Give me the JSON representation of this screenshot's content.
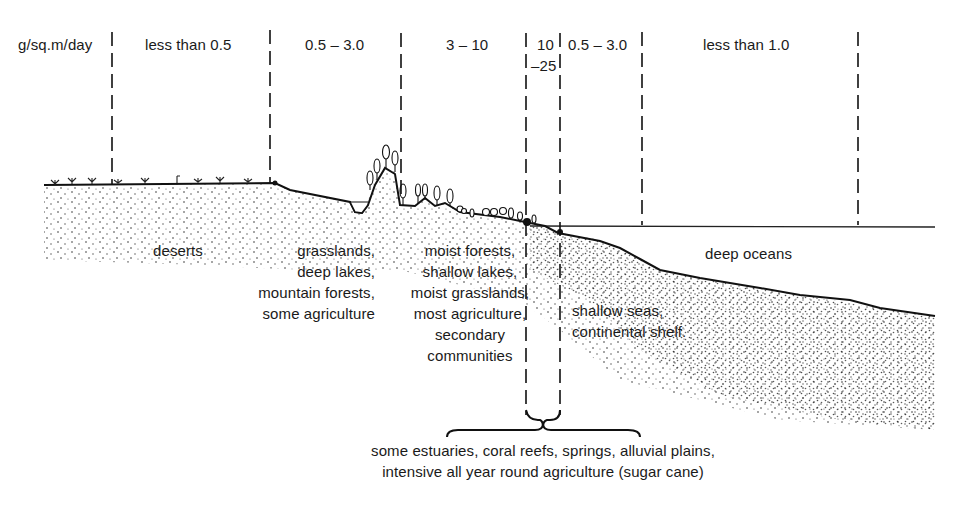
{
  "header": {
    "unit": "g/sq.m/day",
    "zones": [
      {
        "label": "less than 0.5"
      },
      {
        "label": "0.5 – 3.0"
      },
      {
        "label": "3 – 10"
      },
      {
        "label": "10",
        "label2": "–25"
      },
      {
        "label": "0.5 – 3.0"
      },
      {
        "label": "less than 1.0"
      }
    ]
  },
  "ecosystems": {
    "deserts": "deserts",
    "grasslands": [
      "grasslands,",
      "deep lakes,",
      "mountain forests,",
      "some agriculture"
    ],
    "moist": [
      "moist forests,",
      "shallow lakes,",
      "moist grasslands,",
      "most agriculture,",
      "secondary",
      "communities"
    ],
    "shallow_seas": [
      "shallow seas,",
      "continental shelf."
    ],
    "deep_oceans": "deep oceans",
    "high_productivity": [
      "some estuaries, coral reefs, springs, alluvial plains,",
      "intensive all year round agriculture (sugar cane)"
    ]
  }
}
